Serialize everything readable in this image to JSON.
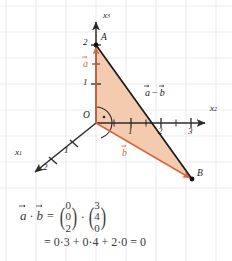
{
  "figure": {
    "type": "3d-coordinate-diagram",
    "background_color": "#ffffff",
    "grid_color": "#e9e9ec",
    "axis_color": "#2b2b2b",
    "triangle_fill": "#f5cbb0",
    "triangle_fill_opacity": 0.95,
    "vector_orange": "#d2693c",
    "axes": [
      {
        "name": "x1",
        "label": "x",
        "sub": "1",
        "label_x": 16,
        "label_y": 154,
        "ticks": [
          "1",
          "2"
        ]
      },
      {
        "name": "x2",
        "label": "x",
        "sub": "2",
        "label_x": 211,
        "label_y": 111,
        "ticks": [
          "1",
          "2",
          "3"
        ]
      },
      {
        "name": "x3",
        "label": "x",
        "sub": "3",
        "label_x": 103,
        "label_y": 12,
        "ticks": [
          "1",
          "2"
        ]
      }
    ],
    "tick_labels": {
      "x1": [
        {
          "text": "1",
          "x": 64,
          "y": 152
        },
        {
          "text": "2",
          "x": 42,
          "y": 167
        }
      ],
      "x2": [
        {
          "text": "1",
          "x": 127,
          "y": 132
        },
        {
          "text": "2",
          "x": 157,
          "y": 132
        },
        {
          "text": "3",
          "x": 187,
          "y": 132
        }
      ],
      "x3": [
        {
          "text": "1",
          "x": 82,
          "y": 83
        },
        {
          "text": "2",
          "x": 82,
          "y": 41
        }
      ]
    },
    "points": [
      {
        "name": "origin",
        "label": "O",
        "x": 96,
        "y": 123,
        "label_x": 84,
        "label_y": 112,
        "dot": false
      },
      {
        "name": "point-a",
        "label": "A",
        "x": 96,
        "y": 45,
        "label_x": 101,
        "label_y": 33,
        "dot": true
      },
      {
        "name": "point-b",
        "label": "B",
        "x": 192,
        "y": 179,
        "label_x": 197,
        "label_y": 170,
        "dot": true
      }
    ],
    "vector_labels": [
      {
        "name": "vector-a",
        "text": "a",
        "color": "#d2693c",
        "x": 84,
        "y": 62
      },
      {
        "name": "vector-b",
        "text": "b",
        "color": "#d2693c",
        "x": 123,
        "y": 151
      },
      {
        "name": "vector-a-minus-b",
        "text_a": "a",
        "operator": "−",
        "text_b": "b",
        "color": "#1a1a1a",
        "x": 146,
        "y": 92
      }
    ],
    "right_angle_marker": {
      "name": "right-angle-dot",
      "x": 104,
      "y": 118
    },
    "angle_arc": {
      "name": "angle-arc",
      "center_x": 96,
      "center_y": 123,
      "radius": 16
    }
  },
  "equation": {
    "line1": {
      "lhs_a": "a",
      "dot": "·",
      "lhs_b": "b",
      "equals": "=",
      "vector_a": [
        "0",
        "0",
        "2"
      ],
      "mul": "·",
      "vector_b": [
        "3",
        "4",
        "0"
      ]
    },
    "line2": "= 0·3 + 0·4 + 2·0 = 0"
  }
}
